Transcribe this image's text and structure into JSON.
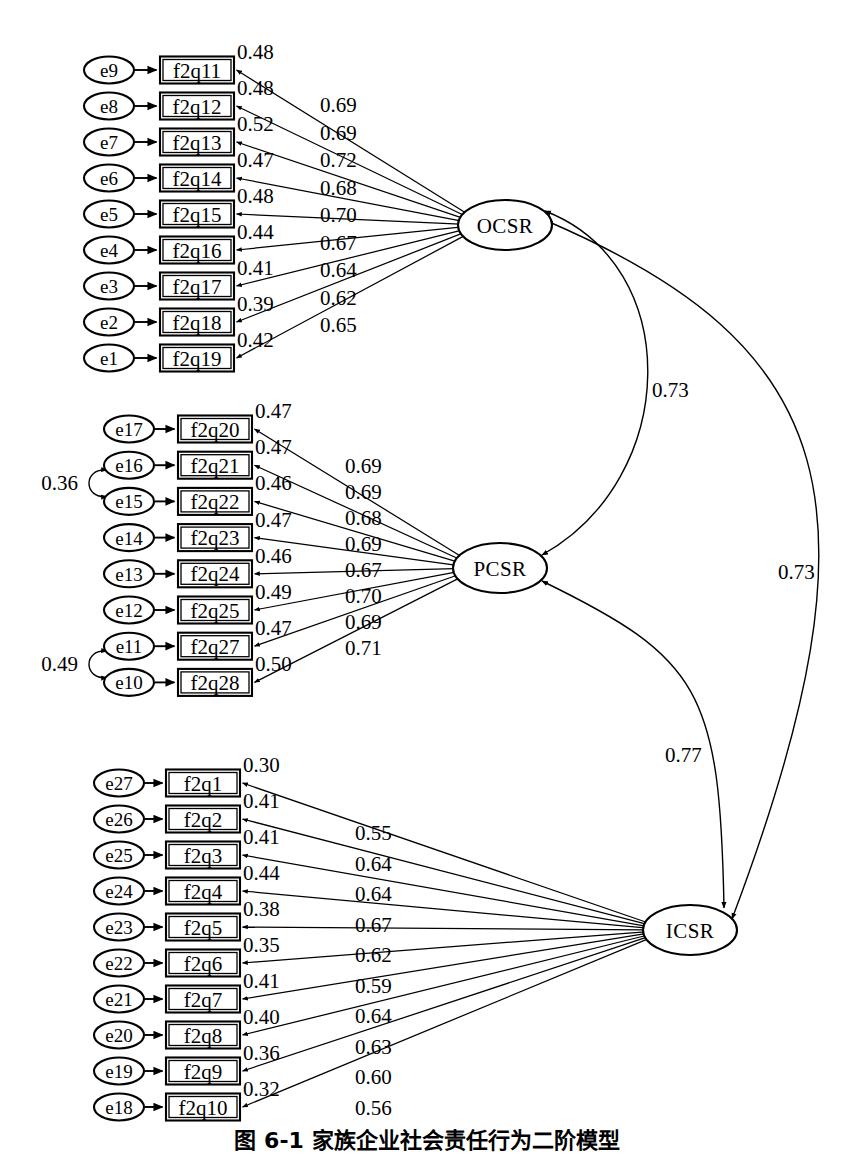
{
  "figure": {
    "caption": "图 6-1  家族企业社会责任行为二阶模型",
    "type": "sem-path-diagram"
  },
  "chart_data": {
    "type": "diagram",
    "title": "图 6-1  家族企业社会责任行为二阶模型",
    "notation": "Ovals are latent factors / error terms, rectangles are observed indicators, numbers above indicator arrows are squared multiple correlations (R²), numbers on factor loading arrows are standardized loadings, curved double-headed arrows are factor correlations.",
    "latent_factors": [
      {
        "name": "OCSR",
        "x": 505,
        "y": 225
      },
      {
        "name": "PCSR",
        "x": 500,
        "y": 568
      },
      {
        "name": "ICSR",
        "x": 690,
        "y": 930
      }
    ],
    "blocks": [
      {
        "factor": "OCSR",
        "indicators": [
          {
            "error": "e9",
            "indicator": "f2q11",
            "r2": "0.48",
            "loading": "0.69"
          },
          {
            "error": "e8",
            "indicator": "f2q12",
            "r2": "0.48",
            "loading": "0.69"
          },
          {
            "error": "e7",
            "indicator": "f2q13",
            "r2": "0.52",
            "loading": "0.72"
          },
          {
            "error": "e6",
            "indicator": "f2q14",
            "r2": "0.47",
            "loading": "0.68"
          },
          {
            "error": "e5",
            "indicator": "f2q15",
            "r2": "0.48",
            "loading": "0.70"
          },
          {
            "error": "e4",
            "indicator": "f2q16",
            "r2": "0.44",
            "loading": "0.67"
          },
          {
            "error": "e3",
            "indicator": "f2q17",
            "r2": "0.41",
            "loading": "0.64"
          },
          {
            "error": "e2",
            "indicator": "f2q18",
            "r2": "0.39",
            "loading": "0.62"
          },
          {
            "error": "e1",
            "indicator": "f2q19",
            "r2": "0.42",
            "loading": "0.65"
          }
        ]
      },
      {
        "factor": "PCSR",
        "indicators": [
          {
            "error": "e17",
            "indicator": "f2q20",
            "r2": "0.47",
            "loading": "0.69"
          },
          {
            "error": "e16",
            "indicator": "f2q21",
            "r2": "0.47",
            "loading": "0.69"
          },
          {
            "error": "e15",
            "indicator": "f2q22",
            "r2": "0.46",
            "loading": "0.68"
          },
          {
            "error": "e14",
            "indicator": "f2q23",
            "r2": "0.47",
            "loading": "0.69"
          },
          {
            "error": "e13",
            "indicator": "f2q24",
            "r2": "0.46",
            "loading": "0.67"
          },
          {
            "error": "e12",
            "indicator": "f2q25",
            "r2": "0.49",
            "loading": "0.70"
          },
          {
            "error": "e11",
            "indicator": "f2q27",
            "r2": "0.47",
            "loading": "0.69"
          },
          {
            "error": "e10",
            "indicator": "f2q28",
            "r2": "0.50",
            "loading": "0.71"
          }
        ]
      },
      {
        "factor": "ICSR",
        "indicators": [
          {
            "error": "e27",
            "indicator": "f2q1",
            "r2": "0.30",
            "loading": "0.55"
          },
          {
            "error": "e26",
            "indicator": "f2q2",
            "r2": "0.41",
            "loading": "0.64"
          },
          {
            "error": "e25",
            "indicator": "f2q3",
            "r2": "0.41",
            "loading": "0.64"
          },
          {
            "error": "e24",
            "indicator": "f2q4",
            "r2": "0.44",
            "loading": "0.67"
          },
          {
            "error": "e23",
            "indicator": "f2q5",
            "r2": "0.38",
            "loading": "0.62"
          },
          {
            "error": "e22",
            "indicator": "f2q6",
            "r2": "0.35",
            "loading": "0.59"
          },
          {
            "error": "e21",
            "indicator": "f2q7",
            "r2": "0.41",
            "loading": "0.64"
          },
          {
            "error": "e20",
            "indicator": "f2q8",
            "r2": "0.40",
            "loading": "0.63"
          },
          {
            "error": "e19",
            "indicator": "f2q9",
            "r2": "0.36",
            "loading": "0.60"
          },
          {
            "error": "e18",
            "indicator": "f2q10",
            "r2": "0.32",
            "loading": "0.56"
          }
        ]
      }
    ],
    "factor_correlations": [
      {
        "from": "OCSR",
        "to": "PCSR",
        "value": "0.73"
      },
      {
        "from": "OCSR",
        "to": "ICSR",
        "value": "0.73"
      },
      {
        "from": "PCSR",
        "to": "ICSR",
        "value": "0.77"
      }
    ],
    "error_correlations": [
      {
        "from": "e16",
        "to": "e15",
        "value": "0.36"
      },
      {
        "from": "e11",
        "to": "e10",
        "value": "0.49"
      }
    ]
  }
}
